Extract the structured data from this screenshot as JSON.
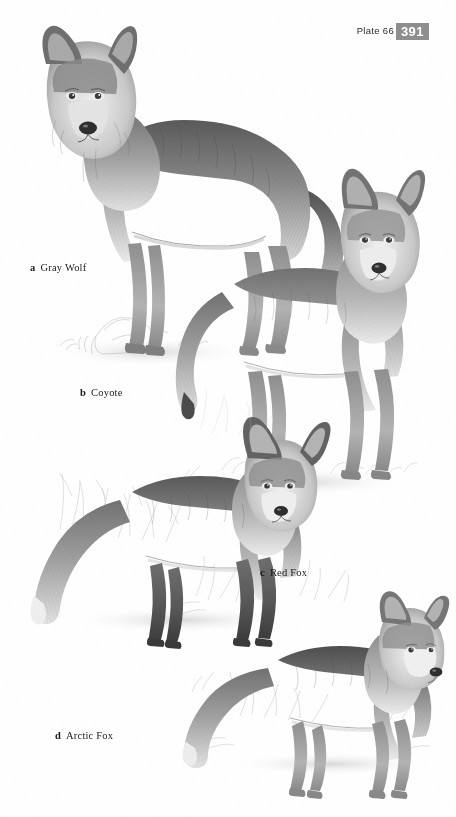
{
  "page": {
    "background_color": "#ffffff",
    "ink_color": "#1a1a1a",
    "badge_color": "#8e8e8e",
    "badge_text_color": "#ffffff"
  },
  "header": {
    "plate_label": "Plate 66",
    "page_number": "391"
  },
  "plate": {
    "medium": "graphite pencil illustration",
    "palette": "grayscale",
    "figures": [
      {
        "letter": "a",
        "label": "Gray Wolf",
        "caption": "a  Gray Wolf",
        "pose": "standing, body in left profile, head turned toward viewer",
        "position": "upper left"
      },
      {
        "letter": "b",
        "label": "Coyote",
        "caption": "b  Coyote",
        "pose": "standing, body in left profile, head facing viewer",
        "position": "upper right / middle"
      },
      {
        "letter": "c",
        "label": "Red Fox",
        "caption": "c  Red Fox",
        "pose": "standing, body in left profile with bushy tail, head facing viewer",
        "position": "lower left / middle"
      },
      {
        "letter": "d",
        "label": "Arctic Fox",
        "caption": "d  Arctic Fox",
        "pose": "standing, body in left profile, head turned to the right",
        "position": "bottom right"
      }
    ]
  }
}
